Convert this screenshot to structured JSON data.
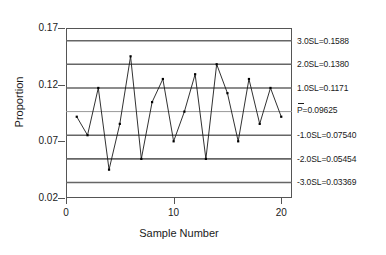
{
  "chart_data": {
    "type": "line",
    "title": "",
    "xlabel": "Sample Number",
    "ylabel": "Proportion",
    "x": [
      1,
      2,
      3,
      4,
      5,
      6,
      7,
      8,
      9,
      10,
      11,
      12,
      13,
      14,
      15,
      16,
      17,
      18,
      19,
      20
    ],
    "values": [
      0.0917,
      0.0754,
      0.1171,
      0.045,
      0.0854,
      0.145,
      0.0545,
      0.1046,
      0.125,
      0.07,
      0.0962,
      0.1292,
      0.0545,
      0.138,
      0.1125,
      0.07,
      0.125,
      0.0854,
      0.1171,
      0.0917
    ],
    "series": [
      {
        "name": "Proportion",
        "values": [
          0.0917,
          0.0754,
          0.1171,
          0.045,
          0.0854,
          0.145,
          0.0545,
          0.1046,
          0.125,
          0.07,
          0.0962,
          0.1292,
          0.0545,
          0.138,
          0.1125,
          0.07,
          0.125,
          0.0854,
          0.1171,
          0.0917
        ]
      }
    ],
    "xlim": [
      0,
      21
    ],
    "ylim": [
      0.02,
      0.17
    ],
    "yticks": [
      0.02,
      0.07,
      0.12,
      0.17
    ],
    "ytick_labels": [
      "0.02",
      "0.07",
      "0.12",
      "0.17"
    ],
    "xticks": [
      0,
      10,
      20
    ],
    "xtick_labels": [
      "0",
      "10",
      "20"
    ],
    "grid": false,
    "legend": "none",
    "control_limits": [
      {
        "id": "sl-plus-3",
        "label": "3.0SL=0.1588",
        "value": 0.1588,
        "sigma": 3
      },
      {
        "id": "sl-plus-2",
        "label": "2.0SL=0.1380",
        "value": 0.138,
        "sigma": 2
      },
      {
        "id": "sl-plus-1",
        "label": "1.0SL=0.1171",
        "value": 0.1171,
        "sigma": 1
      },
      {
        "id": "center-line",
        "label": "P=0.09625",
        "value": 0.09625,
        "sigma": 0,
        "overbar": true
      },
      {
        "id": "sl-minus-1",
        "label": "-1.0SL=0.07540",
        "value": 0.0754,
        "sigma": -1
      },
      {
        "id": "sl-minus-2",
        "label": "-2.0SL=0.05454",
        "value": 0.05454,
        "sigma": -2
      },
      {
        "id": "sl-minus-3",
        "label": "-3.0SL=0.03369",
        "value": 0.03369,
        "sigma": -3
      }
    ]
  },
  "colors": {
    "line": "#1a1a1a",
    "marker": "#000000",
    "limit_line": "#666666",
    "center_line": "#999999",
    "axis": "#555555",
    "text": "#1a1a1a",
    "background": "#ffffff"
  }
}
